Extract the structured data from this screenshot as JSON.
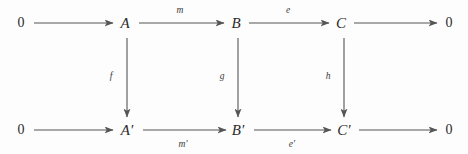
{
  "diagram": {
    "kind": "commutative-diagram",
    "background_color": "#fdfdfd",
    "stroke_color": "#555555",
    "text_color": "#2b2b2b",
    "rows": [
      {
        "id": "top-row",
        "nodes": [
          {
            "id": "top-zero-left",
            "label": "0",
            "x": 21,
            "y": 23
          },
          {
            "id": "top-a",
            "label": "A",
            "x": 125,
            "y": 23
          },
          {
            "id": "top-b",
            "label": "B",
            "x": 236,
            "y": 23
          },
          {
            "id": "top-c",
            "label": "C",
            "x": 341,
            "y": 23
          },
          {
            "id": "top-zero-right",
            "label": "0",
            "x": 449,
            "y": 23
          }
        ],
        "arrows": [
          {
            "id": "top-arrow-1",
            "from": "0",
            "to": "A",
            "label": "",
            "x1": 34,
            "x2": 113,
            "y": 23
          },
          {
            "id": "top-arrow-2",
            "from": "A",
            "to": "B",
            "label": "m",
            "x1": 139,
            "x2": 224,
            "y": 23,
            "label_x": 180,
            "label_y": 11
          },
          {
            "id": "top-arrow-3",
            "from": "B",
            "to": "C",
            "label": "e",
            "x1": 249,
            "x2": 329,
            "y": 23,
            "label_x": 288,
            "label_y": 11
          },
          {
            "id": "top-arrow-4",
            "from": "C",
            "to": "0",
            "label": "",
            "x1": 354,
            "x2": 437,
            "y": 23
          }
        ]
      },
      {
        "id": "bottom-row",
        "nodes": [
          {
            "id": "bottom-zero-left",
            "label": "0",
            "x": 21,
            "y": 130
          },
          {
            "id": "bottom-a-prime",
            "label": "A′",
            "x": 127,
            "y": 130
          },
          {
            "id": "bottom-b-prime",
            "label": "B′",
            "x": 238,
            "y": 130
          },
          {
            "id": "bottom-c-prime",
            "label": "C′",
            "x": 344,
            "y": 130
          },
          {
            "id": "bottom-zero-right",
            "label": "0",
            "x": 449,
            "y": 130
          }
        ],
        "arrows": [
          {
            "id": "bottom-arrow-1",
            "from": "0",
            "to": "A′",
            "label": "",
            "x1": 34,
            "x2": 113,
            "y": 130
          },
          {
            "id": "bottom-arrow-2",
            "from": "A′",
            "to": "B′",
            "label": "m′",
            "x1": 143,
            "x2": 226,
            "y": 130,
            "label_x": 183,
            "label_y": 145
          },
          {
            "id": "bottom-arrow-3",
            "from": "B′",
            "to": "C′",
            "label": "e′",
            "x1": 254,
            "x2": 331,
            "y": 130,
            "label_x": 292,
            "label_y": 145
          },
          {
            "id": "bottom-arrow-4",
            "from": "C′",
            "to": "0",
            "label": "",
            "x1": 359,
            "x2": 437,
            "y": 130
          }
        ]
      }
    ],
    "vertical_arrows": [
      {
        "id": "vertical-arrow-f",
        "from": "A",
        "to": "A′",
        "label": "f",
        "x": 127,
        "y1": 38,
        "y2": 117,
        "label_x": 111,
        "label_y": 77
      },
      {
        "id": "vertical-arrow-g",
        "from": "B",
        "to": "B′",
        "label": "g",
        "x": 238,
        "y1": 38,
        "y2": 117,
        "label_x": 222,
        "label_y": 77
      },
      {
        "id": "vertical-arrow-h",
        "from": "C",
        "to": "C′",
        "label": "h",
        "x": 344,
        "y1": 38,
        "y2": 117,
        "label_x": 328,
        "label_y": 77
      }
    ]
  }
}
